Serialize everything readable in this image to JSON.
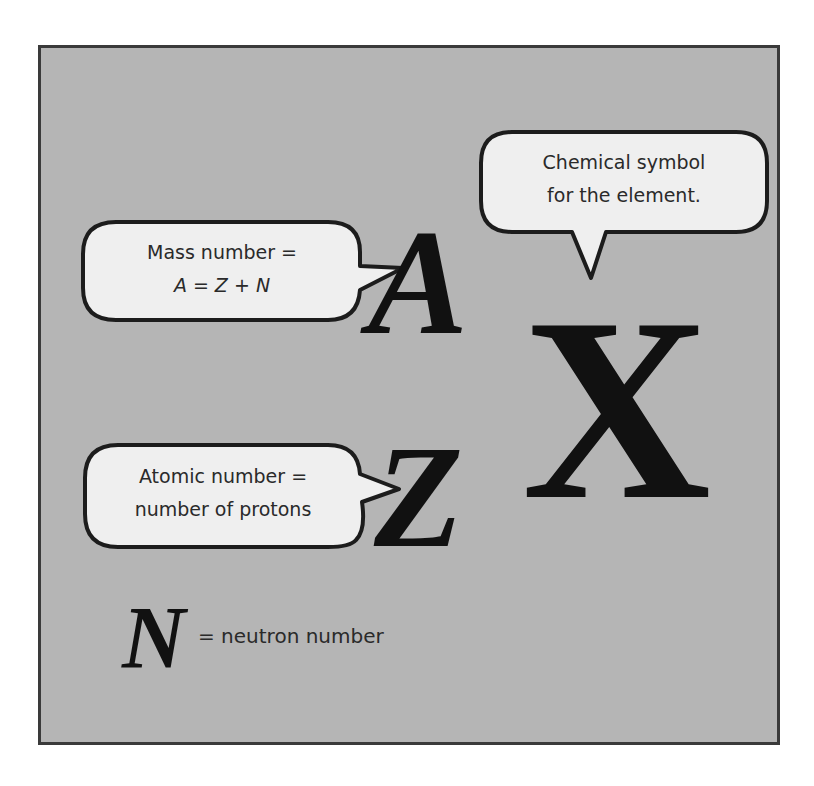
{
  "diagram": {
    "colors": {
      "background": "#b5b5b5",
      "frame_border": "#3a3a3a",
      "bubble_fill": "#efefef",
      "bubble_stroke": "#1c1c1c",
      "glyph": "#111111",
      "text": "#2a2a2a"
    },
    "symbols": {
      "mass_number": "A",
      "atomic_number": "Z",
      "element": "X",
      "neutron_number": "N"
    },
    "callouts": {
      "chemical_symbol": {
        "line1": "Chemical symbol",
        "line2": "for the element."
      },
      "mass_number": {
        "line1": "Mass number =",
        "line2": "A = Z + N"
      },
      "atomic_number": {
        "line1": "Atomic number =",
        "line2": "number of protons"
      }
    },
    "legend": {
      "neutron_text": "= neutron number"
    }
  }
}
